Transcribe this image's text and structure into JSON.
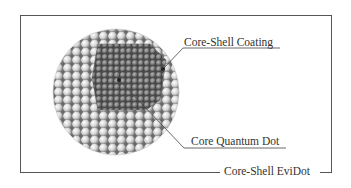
{
  "diagram": {
    "title_label": "Core-Shell EviDot",
    "labels": {
      "coating": "Core-Shell Coating",
      "core": "Core Quantum Dot"
    },
    "colors": {
      "frame": "#555555",
      "shell_sphere": "#d9d9d9",
      "core_sphere": "#7a7a7a",
      "text": "#333333"
    }
  }
}
